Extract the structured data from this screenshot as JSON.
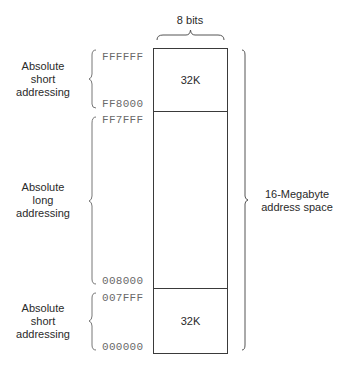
{
  "diagram": {
    "width_label": "8 bits",
    "total_label_line1": "16-Megabyte",
    "total_label_line2": "address space",
    "regions": [
      {
        "name": "top-short",
        "label_lines": [
          "Absolute",
          "short",
          "addressing"
        ],
        "addr_high": "FFFFFF",
        "addr_low": "FF8000",
        "size_label": "32K"
      },
      {
        "name": "long",
        "label_lines": [
          "Absolute",
          "long",
          "addressing"
        ],
        "addr_high": "FF7FFF",
        "addr_low": "008000",
        "size_label": ""
      },
      {
        "name": "bottom-short",
        "label_lines": [
          "Absolute",
          "short",
          "addressing"
        ],
        "addr_high": "007FFF",
        "addr_low": "000000",
        "size_label": "32K"
      }
    ]
  }
}
